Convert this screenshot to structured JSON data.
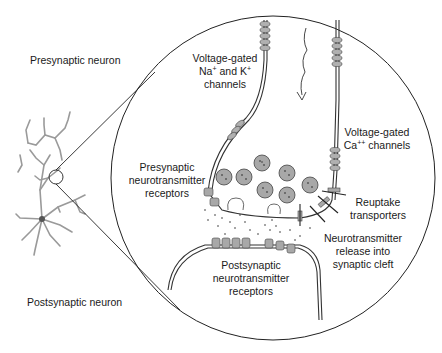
{
  "diagram": {
    "labels": {
      "presynaptic_neuron": "Presynaptic neuron",
      "postsynaptic_neuron": "Postsynaptic neuron",
      "vg_na_k_line1": "Voltage-gated",
      "vg_na_k_line2_a": "Na",
      "vg_na_k_line2_sup1": "+",
      "vg_na_k_line2_b": " and K",
      "vg_na_k_line2_sup2": "+",
      "vg_na_k_line3": "channels",
      "vg_ca_line1": "Voltage-gated",
      "vg_ca_line2_a": "Ca",
      "vg_ca_line2_sup": "++",
      "vg_ca_line2_b": " channels",
      "pre_receptors_line1": "Presynaptic",
      "pre_receptors_line2": "neurotransmitter",
      "pre_receptors_line3": "receptors",
      "reuptake_line1": "Reuptake",
      "reuptake_line2": "transporters",
      "release_line1": "Neurotransmitter",
      "release_line2": "release into",
      "release_line3": "synaptic cleft",
      "post_receptors_line1": "Postsynaptic",
      "post_receptors_line2": "neurotransmitter",
      "post_receptors_line3": "receptors"
    },
    "colors": {
      "line": "#2a2a2a",
      "fill_gray": "#a8a8a8",
      "neuron_gray": "#9a9a9a"
    }
  }
}
